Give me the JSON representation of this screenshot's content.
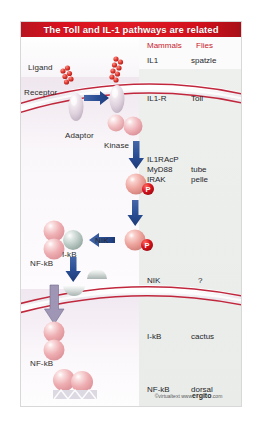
{
  "figure": {
    "title": "The Toll and IL-1 pathways are related",
    "credit": {
      "copyright": "©virtualtext",
      "www": "www",
      "brand": "ergito",
      "tld": ".com"
    }
  },
  "diagram_labels": {
    "ligand": "Ligand",
    "receptor": "Receptor",
    "adaptor": "Adaptor",
    "kinase": "Kinase",
    "nik": "NIK",
    "ikb_complex": "I-kB",
    "nfkb_cytoplasm": "NF-kB",
    "nfkb_nucleus": "NF-kB",
    "phospho_1": "P",
    "phospho_2": "P"
  },
  "comparison": {
    "headers": {
      "mammals": "Mammals",
      "flies": "Flies"
    },
    "rows": [
      {
        "mammals": "IL1",
        "flies": "spatzle"
      },
      {
        "mammals": "IL1-R",
        "flies": "Toll"
      },
      {
        "mammals": "IL1RAcP",
        "flies": ""
      },
      {
        "mammals": "MyD88",
        "flies": "tube"
      },
      {
        "mammals": "IRAK",
        "flies": "pelle"
      },
      {
        "mammals": "NIK",
        "flies": "?"
      },
      {
        "mammals": "I-kB",
        "flies": "cactus"
      },
      {
        "mammals": "NF-kB",
        "flies": "dorsal"
      }
    ]
  },
  "colors": {
    "title_bar": "#d9121f",
    "header_red": "#c8202c",
    "arrow_blue": "#2b4f96",
    "membrane_red": "#c0263c",
    "phospho_red": "#cf1020",
    "protein_pink": "#e8a9ad",
    "ikb_gray": "#aebdb8"
  }
}
